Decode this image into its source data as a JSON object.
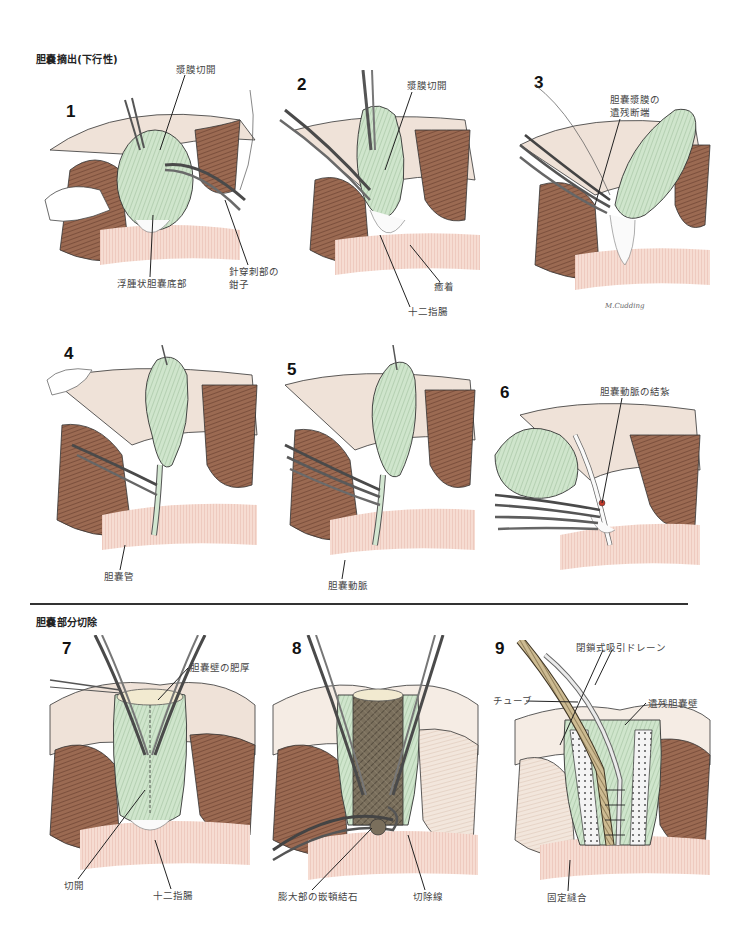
{
  "sections": [
    {
      "title": "胆嚢摘出(下行性)"
    },
    {
      "title": "胆嚢部分切除"
    }
  ],
  "colors": {
    "gallbladder_green": "#c9e2c8",
    "liver_brown": "#8a5a44",
    "liver_light": "#e8d6c8",
    "duodenum_pink": "#f2cfc3",
    "instrument_gray": "#6a6a6a",
    "stone_dark": "#5d5444",
    "line_dark": "#2b2b2b"
  },
  "panels": [
    {
      "number": "1",
      "labels": [
        "漿膜切開",
        "浮腫状胆嚢底部",
        "針穿刺部の",
        "鉗子"
      ]
    },
    {
      "number": "2",
      "labels": [
        "漿膜切開",
        "癒着",
        "十二指腸"
      ]
    },
    {
      "number": "3",
      "labels": [
        "胆嚢漿膜の",
        "遺残断端"
      ],
      "signature": "M.Cudding"
    },
    {
      "number": "4",
      "labels": [
        "胆嚢管"
      ]
    },
    {
      "number": "5",
      "labels": [
        "胆嚢動脈"
      ]
    },
    {
      "number": "6",
      "labels": [
        "胆嚢動脈の結紮"
      ]
    },
    {
      "number": "7",
      "labels": [
        "胆嚢壁の肥厚",
        "切開",
        "十二指腸"
      ]
    },
    {
      "number": "8",
      "labels": [
        "膨大部の嵌頓結石",
        "切除線"
      ]
    },
    {
      "number": "9",
      "labels": [
        "閉鎖式吸引ドレーン",
        "チューブ",
        "遺残胆嚢壁",
        "固定縫合"
      ]
    }
  ]
}
